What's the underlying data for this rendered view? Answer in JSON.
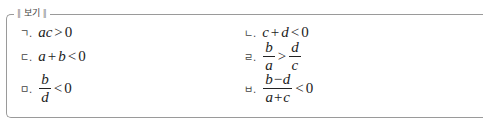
{
  "title": "보기",
  "items": [
    {
      "label": "ㄱ.",
      "expr": "ac>0"
    },
    {
      "label": "ㄴ.",
      "expr": "c+d<0"
    },
    {
      "label": "ㄷ.",
      "expr": "a+b<0"
    },
    {
      "label": "ㄹ.",
      "expr": "b/a > d/c",
      "num1": "b",
      "den1": "a",
      "op": ">",
      "num2": "d",
      "den2": "c"
    },
    {
      "label": "ㅁ.",
      "expr": "b/d<0",
      "num": "b",
      "den": "d",
      "op": "<",
      "rhs": "0"
    },
    {
      "label": "ㅂ.",
      "expr": "(b−d)/(a+c)<0",
      "num": "b−d",
      "den": "a+c",
      "op": "<",
      "rhs": "0"
    }
  ]
}
